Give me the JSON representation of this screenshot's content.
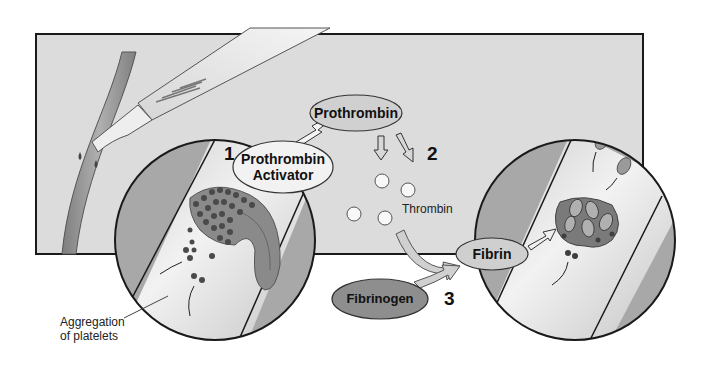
{
  "diagram": {
    "steps": [
      {
        "number": "1",
        "label": "Prothrombin Activator",
        "line1": "Prothrombin",
        "line2": "Activator"
      },
      {
        "number": "2",
        "label": "Prothrombin"
      },
      {
        "number": "3",
        "label": "Fibrin"
      }
    ],
    "labels": {
      "prothrombin": "Prothrombin",
      "activator_line1": "Prothrombin",
      "activator_line2": "Activator",
      "thrombin": "Thrombin",
      "fibrinogen": "Fibrinogen",
      "fibrin": "Fibrin",
      "aggregation_line1": "Aggregation",
      "aggregation_line2": "of platelets",
      "step1": "1",
      "step2": "2",
      "step3": "3"
    },
    "colors": {
      "panel": "#dcdcdc",
      "vessel": "#9a9a9a",
      "vessel_light": "#e6e6e6",
      "oval_light": "#d4d4d4",
      "fibrinogen": "#8e8e8e",
      "outline": "#1a1a1a"
    }
  }
}
